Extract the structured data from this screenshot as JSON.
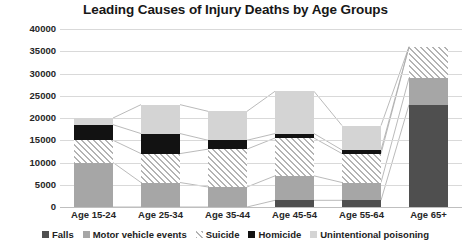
{
  "chart_data": {
    "type": "bar",
    "subtype": "stacked-bar-with-connectors",
    "title": "Leading Causes of Injury Deaths by Age Groups",
    "xlabel": "",
    "ylabel": "",
    "ylim": [
      0,
      40000
    ],
    "ytick_step": 5000,
    "grid": true,
    "legend_position": "bottom",
    "categories": [
      "Age 15-24",
      "Age 25-34",
      "Age 35-44",
      "Age 45-54",
      "Age 55-64",
      "Age 65+"
    ],
    "ytick_labels": [
      "40000",
      "35000",
      "30000",
      "25000",
      "20000",
      "15000",
      "10000",
      "5000",
      "0"
    ],
    "ytick_values": [
      40000,
      35000,
      30000,
      25000,
      20000,
      15000,
      10000,
      5000,
      0
    ],
    "series": [
      {
        "name": "Falls",
        "color": "#4f4f4f",
        "pattern": "solid",
        "values": [
          0,
          0,
          0,
          1500,
          1500,
          23000
        ]
      },
      {
        "name": "Motor vehicle events",
        "color": "#a6a6a6",
        "pattern": "solid",
        "values": [
          10000,
          5500,
          4500,
          5500,
          4000,
          6000
        ]
      },
      {
        "name": "Suicide",
        "color": "#b3b3b3",
        "pattern": "diagonal-hatch",
        "values": [
          5000,
          6500,
          8500,
          8500,
          6500,
          7000
        ]
      },
      {
        "name": "Homicide",
        "color": "#121212",
        "pattern": "solid",
        "values": [
          3500,
          4500,
          2000,
          1000,
          800,
          0
        ]
      },
      {
        "name": "Unintentional poisoning",
        "color": "#d4d4d4",
        "pattern": "solid",
        "values": [
          1500,
          6500,
          6500,
          9500,
          5500,
          0
        ]
      }
    ],
    "totals": [
      20000,
      23000,
      21500,
      26000,
      18300,
      36000
    ]
  },
  "legend": {
    "items": [
      {
        "label": "Falls",
        "swatch_color": "#4f4f4f"
      },
      {
        "label": "Motor vehicle events",
        "swatch_color": "#a6a6a6"
      },
      {
        "label": "Suicide",
        "swatch_color": "#b3b3b3"
      },
      {
        "label": "Homicide",
        "swatch_color": "#121212"
      },
      {
        "label": "Unintentional poisoning",
        "swatch_color": "#d4d4d4"
      }
    ]
  },
  "colors": {
    "grid": "#d9d9d9",
    "axis_text": "#262626",
    "title_text": "#171717",
    "connector": "#a8a8a8",
    "background": "#ffffff"
  }
}
